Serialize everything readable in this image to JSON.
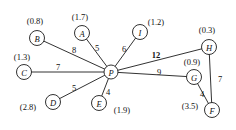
{
  "figure": {
    "name": "weighted-star-graph",
    "background": "#ffffff",
    "stroke_color": "#1b1b1b",
    "text_color": "#111111",
    "width": 236,
    "height": 130
  },
  "nodes": [
    {
      "id": "B",
      "letter": "B",
      "value": "(0.8)",
      "cx": 37,
      "cy": 38,
      "r": 7.5,
      "label_x": 35,
      "label_y": 21
    },
    {
      "id": "A",
      "letter": "A",
      "value": "(1.7)",
      "cx": 82,
      "cy": 33,
      "r": 7.5,
      "label_x": 80,
      "label_y": 17
    },
    {
      "id": "I",
      "letter": "I",
      "value": "(1.2)",
      "cx": 140,
      "cy": 32,
      "r": 7.5,
      "label_x": 156,
      "label_y": 22
    },
    {
      "id": "H",
      "letter": "H",
      "value": "(0.3)",
      "cx": 209,
      "cy": 47,
      "r": 7.5,
      "label_x": 207,
      "label_y": 30
    },
    {
      "id": "C",
      "letter": "C",
      "value": "(1.3)",
      "cx": 24,
      "cy": 72,
      "r": 7.5,
      "label_x": 22,
      "label_y": 57
    },
    {
      "id": "P",
      "letter": "P",
      "value": "",
      "cx": 111,
      "cy": 72,
      "r": 7.0,
      "label_x": 0,
      "label_y": 0
    },
    {
      "id": "G",
      "letter": "G",
      "value": "(0.9)",
      "cx": 194,
      "cy": 77,
      "r": 7.5,
      "label_x": 192,
      "label_y": 62
    },
    {
      "id": "D",
      "letter": "D",
      "value": "(2.8)",
      "cx": 53,
      "cy": 102,
      "r": 7.5,
      "label_x": 28,
      "label_y": 107
    },
    {
      "id": "E",
      "letter": "E",
      "value": "(1.9)",
      "cx": 99,
      "cy": 103,
      "r": 7.5,
      "label_x": 122,
      "label_y": 110
    },
    {
      "id": "F",
      "letter": "F",
      "value": "(3.5)",
      "cx": 212,
      "cy": 110,
      "r": 7.5,
      "label_x": 190,
      "label_y": 106
    }
  ],
  "edges": [
    {
      "from": "B",
      "to": "P",
      "weight": "8",
      "label_x": 74,
      "label_y": 50,
      "bold": false
    },
    {
      "from": "A",
      "to": "P",
      "weight": "5",
      "label_x": 97,
      "label_y": 48,
      "bold": false
    },
    {
      "from": "I",
      "to": "P",
      "weight": "6",
      "label_x": 124,
      "label_y": 49,
      "bold": false
    },
    {
      "from": "H",
      "to": "P",
      "weight": "12",
      "label_x": 156,
      "label_y": 55,
      "bold": true
    },
    {
      "from": "C",
      "to": "P",
      "weight": "7",
      "label_x": 58,
      "label_y": 67,
      "bold": false
    },
    {
      "from": "G",
      "to": "P",
      "weight": "9",
      "label_x": 159,
      "label_y": 72,
      "bold": false
    },
    {
      "from": "D",
      "to": "P",
      "weight": "5",
      "label_x": 74,
      "label_y": 88,
      "bold": false
    },
    {
      "from": "E",
      "to": "P",
      "weight": "4",
      "label_x": 108,
      "label_y": 92,
      "bold": false
    },
    {
      "from": "H",
      "to": "F",
      "weight": "7",
      "label_x": 220,
      "label_y": 79,
      "bold": false
    },
    {
      "from": "G",
      "to": "F",
      "weight": "4",
      "label_x": 202,
      "label_y": 94,
      "bold": false
    }
  ]
}
